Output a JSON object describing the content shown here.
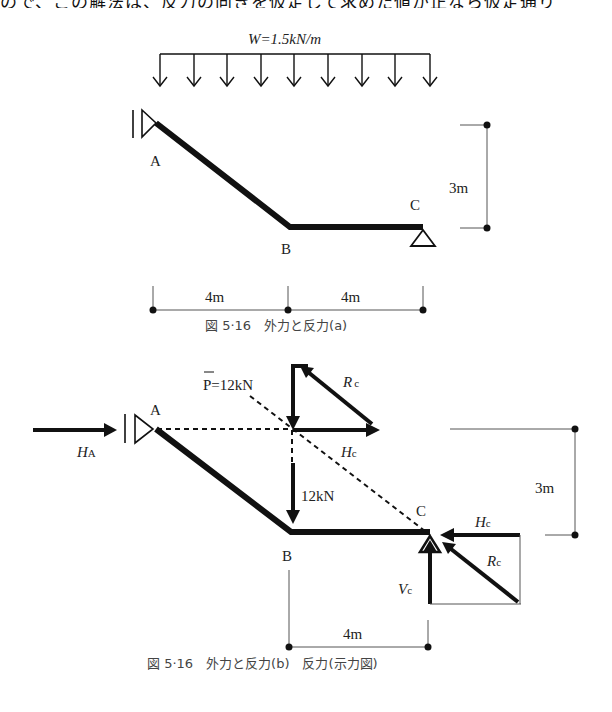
{
  "header_fragment": "ので、この解法は、反力の向きを仮定して求めた値が正なら仮定通り",
  "figure_a": {
    "load_label": "W=1.5kN/m",
    "node_labels": {
      "A": "A",
      "B": "B",
      "C": "C"
    },
    "height_dim": "3m",
    "span_dims": [
      "4m",
      "4m"
    ],
    "caption": "図 5·16　外力と反力(a)"
  },
  "figure_b": {
    "resultant_label": "P=12kN",
    "load_arrow_label": "12kN",
    "node_labels": {
      "A": "A",
      "B": "B",
      "C": "C"
    },
    "ha_label": {
      "main": "H",
      "sub": "A"
    },
    "hc_label_top": {
      "main": "H",
      "sub": "c"
    },
    "rc_label_top": {
      "main": "R",
      "sub": "c"
    },
    "hc_label_bottom": {
      "main": "H",
      "sub": "c"
    },
    "rc_label_bottom": {
      "main": "R",
      "sub": "c"
    },
    "vc_label": {
      "main": "V",
      "sub": "c"
    },
    "height_dim": "3m",
    "span_dim": "4m",
    "caption": "図 5·16　外力と反力(b)　反力(示力図)"
  },
  "colors": {
    "ink": "#111111",
    "thin": "#555555",
    "caption": "#444444"
  }
}
